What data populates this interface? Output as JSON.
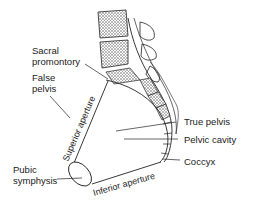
{
  "labels": {
    "sacral_promontory_line1": "Sacral",
    "sacral_promontory_line2": "promontory",
    "false_pelvis_line1": "False",
    "false_pelvis_line2": "pelvis",
    "superior_aperture": "Superior aperture",
    "pubic_symphysis_line1": "Pubic",
    "pubic_symphysis_line2": "symphysis",
    "inferior_aperture": "Inferior aperture",
    "true_pelvis": "True pelvis",
    "pelvic_cavity": "Pelvic cavity",
    "coccyx": "Coccyx"
  },
  "colors": {
    "line": "#222222",
    "bone_fill": "#ffffff",
    "vertebra_texture": "#555555"
  }
}
